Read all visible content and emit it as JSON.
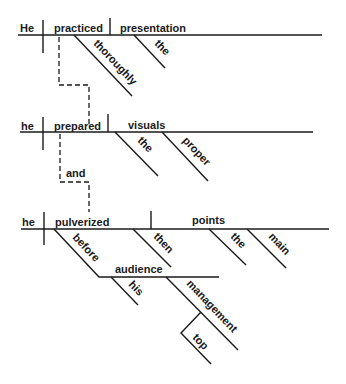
{
  "diagram": {
    "type": "sentence-diagram",
    "clause1": {
      "subject": "He",
      "verb": "practiced",
      "object": "presentation",
      "modifiers": {
        "verb_adverb": "thoroughly",
        "object_article": "the"
      }
    },
    "clause2": {
      "subject": "he",
      "verb": "prepared",
      "object": "visuals",
      "modifiers": {
        "object_article": "the",
        "object_adjective": "proper"
      }
    },
    "conjunction": "and",
    "clause3": {
      "subject": "he",
      "verb": "pulverized",
      "object": "points",
      "modifiers": {
        "verb_adverb": "then",
        "object_article": "the",
        "object_adjective": "main",
        "preposition": "before",
        "prep_object": "audience",
        "prep_object_possessive": "his",
        "prep_object_modifier": "management",
        "modifier_adverb": "top"
      }
    },
    "line_color": "#1a1a1a"
  }
}
